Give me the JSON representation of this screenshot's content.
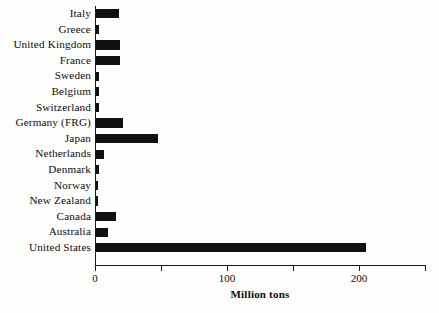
{
  "chart_data": {
    "type": "bar",
    "orientation": "horizontal",
    "title": "",
    "xlabel": "Million tons",
    "ylabel": "",
    "xlim": [
      0,
      250
    ],
    "xticks": [
      0,
      50,
      100,
      150,
      200,
      250
    ],
    "xtick_labels": [
      "0",
      "",
      "100",
      "",
      "200",
      ""
    ],
    "grid": false,
    "legend": false,
    "bar_color": "#111111",
    "categories": [
      "Italy",
      "Greece",
      "United Kingdom",
      "France",
      "Sweden",
      "Belgium",
      "Switzerland",
      "Germany (FRG)",
      "Japan",
      "Netherlands",
      "Denmark",
      "Norway",
      "New Zealand",
      "Canada",
      "Australia",
      "United States"
    ],
    "values": [
      18,
      3,
      19,
      19,
      3,
      3,
      3,
      21,
      48,
      7,
      3,
      2,
      2,
      16,
      10,
      205
    ]
  },
  "caption": {
    "text": ""
  }
}
